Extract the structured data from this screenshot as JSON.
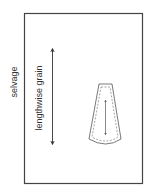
{
  "diagram": {
    "labels": {
      "selvage": "selvage",
      "grain": "lengthwise grain"
    },
    "colors": {
      "frame": "#444444",
      "arrow": "#333333",
      "piece": "#555555",
      "text": "#333333"
    }
  }
}
